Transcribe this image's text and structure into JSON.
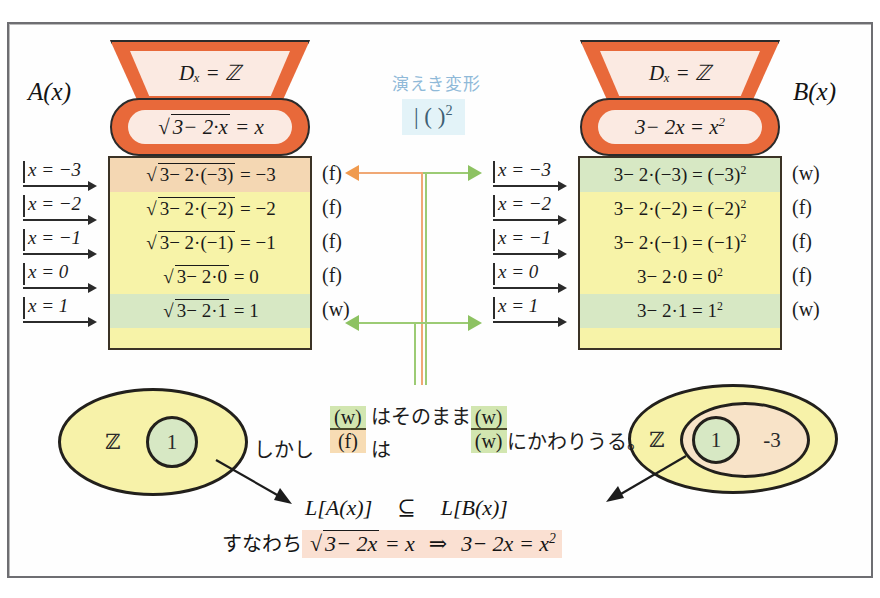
{
  "page": {
    "clipped_top_text": "",
    "background_color": "#ffffff",
    "frame_border_color": "#6e6e72"
  },
  "left_machine": {
    "name_label": "A(x)",
    "domain": "Dₓ = ℤ",
    "equation_prefix": "√",
    "equation_radicand": "3− 2·x",
    "equation_suffix": " = x",
    "machine_color": "#e8693a",
    "inner_color": "#fbeae2"
  },
  "right_machine": {
    "name_label": "B(x)",
    "domain": "Dₓ = ℤ",
    "equation": "3− 2x = x",
    "equation_exponent": "2",
    "machine_color": "#e8693a",
    "inner_color": "#fbeae2"
  },
  "center": {
    "title": "演えき変形",
    "operation": "| ( )",
    "operation_exponent": "2",
    "title_color": "#8fb9d8",
    "op_bg_color": "#e3f3f8",
    "orange_color": "#f0a875",
    "green_color": "#9ccb74"
  },
  "x_inputs": [
    {
      "label": "x = −3"
    },
    {
      "label": "x = −2"
    },
    {
      "label": "x = −1"
    },
    {
      "label": "x =  0"
    },
    {
      "label": "x =  1"
    }
  ],
  "left_table": {
    "rows": [
      {
        "radicand": "3− 2·(−3)",
        "tail": " = −3",
        "verdict": "(f)",
        "fill": "c-orange"
      },
      {
        "radicand": "3− 2·(−2)",
        "tail": " = −2",
        "verdict": "(f)",
        "fill": "c-yellow"
      },
      {
        "radicand": "3− 2·(−1)",
        "tail": " = −1",
        "verdict": "(f)",
        "fill": "c-yellow"
      },
      {
        "radicand": "3− 2·0",
        "tail": " = 0",
        "verdict": "(f)",
        "fill": "c-yellow"
      },
      {
        "radicand": "3− 2·1",
        "tail": " = 1",
        "verdict": "(w)",
        "fill": "c-green"
      }
    ]
  },
  "right_table": {
    "rows": [
      {
        "expr": "3− 2·(−3) = (−3)",
        "exp": "2",
        "verdict": "(w)",
        "fill": "c-green"
      },
      {
        "expr": "3− 2·(−2) = (−2)",
        "exp": "2",
        "verdict": "(f)",
        "fill": "c-yellow"
      },
      {
        "expr": "3− 2·(−1) = (−1)",
        "exp": "2",
        "verdict": "(f)",
        "fill": "c-yellow"
      },
      {
        "expr": "3− 2·0 = 0",
        "exp": "2",
        "verdict": "(f)",
        "fill": "c-yellow"
      },
      {
        "expr": "3− 2·1 = 1",
        "exp": "2",
        "verdict": "(w)",
        "fill": "c-green"
      }
    ]
  },
  "left_venn": {
    "set_label": "ℤ",
    "solution_label": "1",
    "outer_color": "#f7f2a9",
    "inner_color": "#d7e8c4"
  },
  "right_venn": {
    "set_label": "ℤ",
    "solution_label": "1",
    "extra_label": "-3",
    "outer_color": "#f7f2a9",
    "middle_color": "#f8e3c8",
    "inner_color": "#d7e8c4"
  },
  "middle_text": {
    "line1_frac_num": "(w)",
    "line1_between": "はそのまま",
    "line1_frac2_num": "(w)",
    "line2_prefix": "しかし",
    "line2_frac_den": "(f)",
    "line2_mid": "は",
    "line2_frac2_den": "(w)",
    "line2_suffix": "にかわりうる。"
  },
  "conclusion": {
    "line1_left": "L[A(x)]",
    "line1_symbol": "⊆",
    "line1_right": "L[B(x)]",
    "line2_prefix": "すなわち",
    "line2_sqrt_radicand": "3− 2x",
    "line2_eq_tail": " = x",
    "line2_implies": "⇒",
    "line2_right": "3− 2x = x",
    "line2_right_exp": "2",
    "highlight_color": "#fae0d2"
  }
}
